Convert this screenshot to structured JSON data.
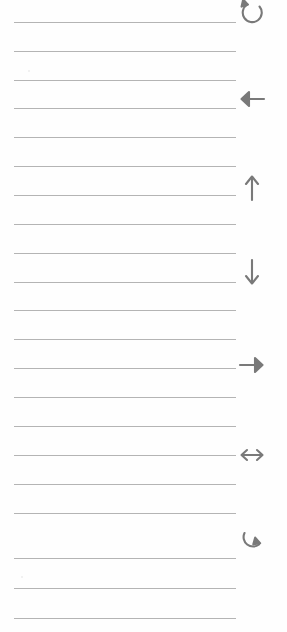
{
  "page": {
    "background_color": "#fefefe",
    "width": 287,
    "height": 632
  },
  "ruling": {
    "line_color": "#b4b4b4",
    "line_thickness": 1,
    "line_count": 21,
    "left_x": 14,
    "right_x": 236,
    "spacing": 29,
    "lines": [
      {
        "y": 22
      },
      {
        "y": 51
      },
      {
        "y": 80
      },
      {
        "y": 108
      },
      {
        "y": 137
      },
      {
        "y": 166
      },
      {
        "y": 195
      },
      {
        "y": 224
      },
      {
        "y": 253
      },
      {
        "y": 282
      },
      {
        "y": 310
      },
      {
        "y": 339
      },
      {
        "y": 368
      },
      {
        "y": 397
      },
      {
        "y": 426
      },
      {
        "y": 455
      },
      {
        "y": 484
      },
      {
        "y": 513
      },
      {
        "y": 558
      },
      {
        "y": 588
      },
      {
        "y": 618
      }
    ]
  },
  "margin_glyphs": {
    "color": "#797979",
    "center_x": 252,
    "items": [
      {
        "icon": "rotate-counter-clockwise-icon",
        "label": "Rotate counter-clockwise",
        "y": -4,
        "clipped": "top"
      },
      {
        "icon": "arrow-left-icon",
        "label": "Arrow left",
        "y": 82,
        "clipped": "none"
      },
      {
        "icon": "arrow-up-icon",
        "label": "Arrow up",
        "y": 170,
        "clipped": "none"
      },
      {
        "icon": "arrow-down-icon",
        "label": "Arrow down",
        "y": 256,
        "clipped": "none"
      },
      {
        "icon": "arrow-right-icon",
        "label": "Arrow right",
        "y": 348,
        "clipped": "none"
      },
      {
        "icon": "arrow-left-right-icon",
        "label": "Arrow left-right",
        "y": 438,
        "clipped": "none"
      },
      {
        "icon": "rotate-clockwise-icon",
        "label": "Rotate clockwise",
        "y": 524,
        "clipped": "none"
      }
    ]
  },
  "specks": [
    {
      "x": 28,
      "y": 70
    },
    {
      "x": 21,
      "y": 576
    }
  ]
}
